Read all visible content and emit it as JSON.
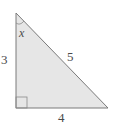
{
  "diagram": {
    "type": "right-triangle",
    "fill_color": "#e6e6e6",
    "stroke_color": "#7a7a7a",
    "labels": {
      "angle": "x",
      "vertical_leg": "3",
      "hypotenuse": "5",
      "horizontal_leg": "4"
    },
    "marks": {
      "right_angle": "bottom-left",
      "angle_arc": "top"
    }
  }
}
